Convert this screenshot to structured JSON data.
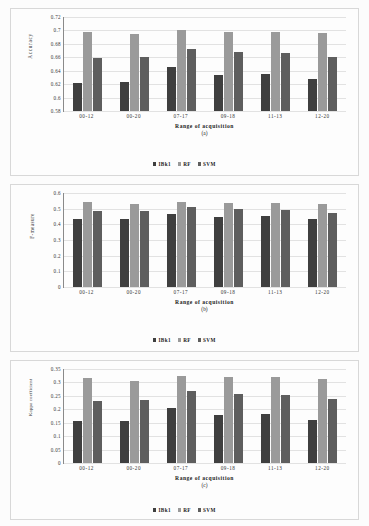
{
  "figure": {
    "background": "#fcfcfc",
    "panel_border": "#d8d8d8",
    "series_colors": [
      "#3f3f3f",
      "#9a9a9a",
      "#5e5e5e"
    ]
  },
  "legend": {
    "entries": [
      {
        "label": "IBk1",
        "color": "#3f3f3f"
      },
      {
        "label": "RF",
        "color": "#9a9a9a"
      },
      {
        "label": "SVM",
        "color": "#5e5e5e"
      }
    ]
  },
  "chart_data": [
    {
      "type": "bar",
      "panel": "a",
      "caption": "(a)",
      "title": "",
      "xlabel": "Range of acquisition",
      "ylabel": "Accuracy",
      "categories": [
        "00-12",
        "00-20",
        "07-17",
        "09-18",
        "11-13",
        "12-20"
      ],
      "ylim": [
        0.58,
        0.72
      ],
      "yticks": [
        0.58,
        0.6,
        0.62,
        0.64,
        0.66,
        0.68,
        0.7,
        0.72
      ],
      "ytick_labels": [
        "0.58",
        "0.6",
        "0.62",
        "0.64",
        "0.66",
        "0.68",
        "0.7",
        "0.72"
      ],
      "grid": true,
      "legend_position": "bottom",
      "series": [
        {
          "name": "IBk1",
          "values": [
            0.622,
            0.623,
            0.645,
            0.633,
            0.635,
            0.627
          ]
        },
        {
          "name": "RF",
          "values": [
            0.697,
            0.694,
            0.7,
            0.698,
            0.698,
            0.696
          ]
        },
        {
          "name": "SVM",
          "values": [
            0.659,
            0.66,
            0.672,
            0.668,
            0.666,
            0.661
          ]
        }
      ]
    },
    {
      "type": "bar",
      "panel": "b",
      "caption": "(b)",
      "title": "",
      "xlabel": "Range of acquisition",
      "ylabel": "F-measure",
      "categories": [
        "00-12",
        "00-20",
        "07-17",
        "09-18",
        "11-13",
        "12-20"
      ],
      "ylim": [
        0,
        0.6
      ],
      "yticks": [
        0,
        0.1,
        0.2,
        0.3,
        0.4,
        0.5,
        0.6
      ],
      "ytick_labels": [
        "0",
        "0.1",
        "0.2",
        "0.3",
        "0.4",
        "0.5",
        "0.6"
      ],
      "grid": true,
      "legend_position": "bottom",
      "series": [
        {
          "name": "IBk1",
          "values": [
            0.437,
            0.437,
            0.466,
            0.45,
            0.455,
            0.435
          ]
        },
        {
          "name": "RF",
          "values": [
            0.54,
            0.53,
            0.545,
            0.538,
            0.537,
            0.527
          ]
        },
        {
          "name": "SVM",
          "values": [
            0.485,
            0.483,
            0.508,
            0.495,
            0.492,
            0.472
          ]
        }
      ]
    },
    {
      "type": "bar",
      "panel": "c",
      "caption": "(c)",
      "title": "",
      "xlabel": "Range of acquisition",
      "ylabel": "Kappa coefficient",
      "categories": [
        "00-12",
        "00-20",
        "07-17",
        "09-18",
        "11-13",
        "12-20"
      ],
      "ylim": [
        0,
        0.35
      ],
      "yticks": [
        0,
        0.05,
        0.1,
        0.15,
        0.2,
        0.25,
        0.3,
        0.35
      ],
      "ytick_labels": [
        "0",
        "0.05",
        "0.1",
        "0.15",
        "0.2",
        "0.25",
        "0.3",
        "0.35"
      ],
      "grid": true,
      "legend_position": "bottom",
      "series": [
        {
          "name": "IBk1",
          "values": [
            0.155,
            0.157,
            0.205,
            0.178,
            0.184,
            0.161
          ]
        },
        {
          "name": "RF",
          "values": [
            0.315,
            0.307,
            0.323,
            0.322,
            0.319,
            0.313
          ]
        },
        {
          "name": "SVM",
          "values": [
            0.231,
            0.236,
            0.268,
            0.257,
            0.252,
            0.239
          ]
        }
      ]
    }
  ]
}
